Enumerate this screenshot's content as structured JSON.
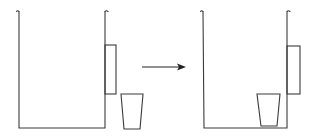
{
  "diagram": {
    "type": "process-illustration",
    "colors": {
      "line": "#3a3a3a",
      "arrow": "#222222",
      "background": "#ffffff"
    },
    "panels": [
      {
        "name": "before",
        "container": {
          "left_x": 19,
          "right_x": 105,
          "top_y": 11,
          "bottom_y": 128
        },
        "side_box": {
          "x": 105,
          "y": 45,
          "width": 11,
          "height": 49
        },
        "cup": {
          "top_left_x": 121,
          "top_right_x": 143,
          "top_y": 94,
          "bottom_left_x": 124,
          "bottom_right_x": 140,
          "bottom_y": 129,
          "position": "outside"
        }
      },
      {
        "name": "after",
        "container": {
          "left_x": 203,
          "right_x": 287,
          "top_y": 11,
          "bottom_y": 128
        },
        "side_box": {
          "x": 287,
          "y": 46,
          "width": 13,
          "height": 48
        },
        "cup": {
          "top_left_x": 257,
          "top_right_x": 280,
          "top_y": 94,
          "bottom_left_x": 261,
          "bottom_right_x": 277,
          "bottom_y": 126,
          "position": "inside"
        }
      }
    ],
    "arrow": {
      "from_x": 142,
      "to_x": 186,
      "y": 67,
      "direction": "right"
    }
  }
}
